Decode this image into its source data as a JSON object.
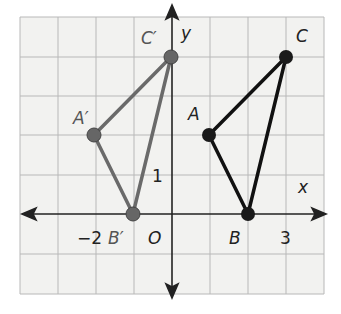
{
  "figure": {
    "axes": {
      "x_label": "x",
      "y_label": "y",
      "origin_label": "O"
    },
    "tick_labels": {
      "x_neg": "−2",
      "x_pos": "3",
      "y_pos": "1"
    },
    "grid": {
      "x_range": [
        -4,
        4
      ],
      "y_range": [
        -2,
        5
      ]
    },
    "original_triangle": {
      "color": "#111111",
      "points": [
        {
          "name": "A",
          "x": 1,
          "y": 2
        },
        {
          "name": "B",
          "x": 2,
          "y": 0
        },
        {
          "name": "C",
          "x": 3,
          "y": 4
        }
      ]
    },
    "image_triangle": {
      "color": "#666666",
      "points": [
        {
          "name": "A′",
          "x": -2,
          "y": 2
        },
        {
          "name": "B′",
          "x": -1,
          "y": 0
        },
        {
          "name": "C′",
          "x": 0,
          "y": 4
        }
      ]
    }
  }
}
